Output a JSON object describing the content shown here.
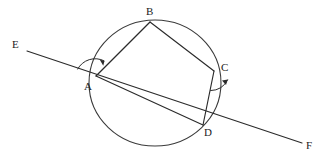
{
  "figure": {
    "width": 327,
    "height": 162,
    "background_color": "#ffffff",
    "stroke_color": "#2b2b2b",
    "circle_color": "#3a3a3a"
  },
  "labels": {
    "A": "A",
    "B": "B",
    "C": "C",
    "D": "D",
    "E": "E",
    "F": "F"
  },
  "geometry": {
    "circle": {
      "cx": 155,
      "cy": 83,
      "r": 63,
      "rx": 66,
      "ry": 63
    },
    "points": {
      "A": {
        "x": 96,
        "y": 76
      },
      "B": {
        "x": 150,
        "y": 22
      },
      "C": {
        "x": 214,
        "y": 71
      },
      "D": {
        "x": 203,
        "y": 125
      },
      "E": {
        "x": 27,
        "y": 51
      },
      "F": {
        "x": 302,
        "y": 143
      }
    },
    "segments": [
      {
        "name": "AB",
        "from": "A",
        "to": "B"
      },
      {
        "name": "BC",
        "from": "B",
        "to": "C"
      },
      {
        "name": "CD",
        "from": "C",
        "to": "D"
      },
      {
        "name": "AD",
        "from": "A",
        "to": "D"
      },
      {
        "name": "EF",
        "from": "E",
        "to": "F"
      }
    ],
    "angle_marks": [
      {
        "name": "angle-at-A",
        "vertex": "A",
        "between": [
          "E",
          "B"
        ]
      },
      {
        "name": "angle-at-C",
        "vertex": "C",
        "between": [
          "D",
          "F"
        ]
      }
    ]
  },
  "label_positions": {
    "A": {
      "left": 84,
      "top": 81
    },
    "B": {
      "left": 146,
      "top": 6
    },
    "C": {
      "left": 221,
      "top": 62
    },
    "D": {
      "left": 204,
      "top": 127
    },
    "E": {
      "left": 12,
      "top": 39
    },
    "F": {
      "left": 306,
      "top": 140
    }
  }
}
